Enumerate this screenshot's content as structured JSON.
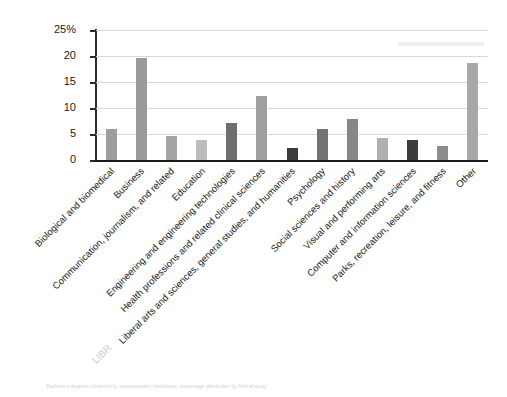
{
  "chart_data": {
    "type": "bar",
    "title": "",
    "subtitle": "",
    "xlabel": "",
    "ylabel": "",
    "ylim": [
      0,
      25
    ],
    "yticks": [
      0,
      5,
      10,
      15,
      20,
      25
    ],
    "ytick_labels": [
      "0",
      "5",
      "10",
      "15",
      "20",
      "25%"
    ],
    "grid": true,
    "legend": "none",
    "categories": [
      "Biological and biomedical",
      "Business",
      "Communication, journalism, and related",
      "Education",
      "Engineering and engineering technologies",
      "Health professions and related clinical sciences",
      "Liberal arts and sciences, general studies, and humanities",
      "Psychology",
      "Social sciences and history",
      "Visual and performing arts",
      "Computer and information sciences",
      "Parks, recreation, leisure, and fitness",
      "Other"
    ],
    "values": [
      6.0,
      19.6,
      4.6,
      3.8,
      7.2,
      12.3,
      2.3,
      5.9,
      7.9,
      4.2,
      3.9,
      2.6,
      18.6
    ],
    "bar_colors": [
      "#9d9d9d",
      "#9a9a9a",
      "#a5a5a5",
      "#bdbdbd",
      "#6e6e6e",
      "#a0a0a0",
      "#3b3b3b",
      "#737373",
      "#878787",
      "#b0b0b0",
      "#3d3d3d",
      "#8d8d8d",
      "#a8a8a8"
    ]
  },
  "axes": {
    "y_unit_suffix": "%",
    "axis_color": "#1a1a1a",
    "grid_color": "#d9d9d9"
  },
  "footer": {
    "caption": "Bachelor's degrees conferred by postsecondary institutions, percentage distribution by field of study"
  },
  "artifacts": {
    "bleed_text": "LIBR"
  }
}
